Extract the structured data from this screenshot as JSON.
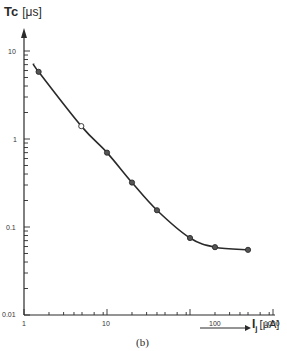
{
  "chart_data": {
    "type": "line",
    "title": "",
    "caption": "(b)",
    "xlabel": "I_j",
    "xlabel_unit": "[μA]",
    "ylabel": "Tc",
    "ylabel_unit": "[μs]",
    "xscale": "log",
    "yscale": "log",
    "xlim": [
      1,
      1000
    ],
    "ylim": [
      0.01,
      10
    ],
    "x_tick_labels": [
      "1",
      "10",
      "100",
      "1000"
    ],
    "y_tick_labels": [
      "10",
      "1",
      "0.1",
      "0.01"
    ],
    "grid": false,
    "legend": null,
    "series": [
      {
        "name": "measured",
        "x": [
          1.5,
          4.9,
          10,
          20,
          40,
          100,
          200,
          500
        ],
        "y": [
          5.8,
          1.4,
          0.7,
          0.32,
          0.155,
          0.075,
          0.059,
          0.055
        ],
        "markers": [
          "filled",
          "open",
          "filled",
          "filled",
          "filled",
          "filled",
          "filled",
          "filled"
        ]
      }
    ]
  },
  "labels": {
    "ylabel": "Tc",
    "ylabel_unit": "[μs]",
    "xlabel": "I",
    "xlabel_sub": "j",
    "xlabel_unit": "[μA]",
    "caption": "(b)",
    "yticks": [
      "10",
      "1",
      "0.1",
      "0.01"
    ],
    "xticks": [
      "1",
      "10",
      "100",
      "1000"
    ]
  }
}
